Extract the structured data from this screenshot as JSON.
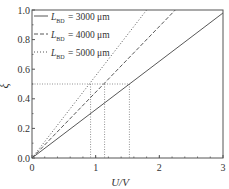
{
  "chart_data": {
    "type": "line",
    "title": "",
    "xlabel": "U/V",
    "ylabel": "ξ",
    "xlim": [
      0,
      3
    ],
    "ylim": [
      0,
      1.0
    ],
    "xticks": [
      0,
      1,
      2,
      3
    ],
    "xtick_labels": [
      "0",
      "1",
      "2",
      "3"
    ],
    "yticks": [
      0.0,
      0.2,
      0.4,
      0.6,
      0.8,
      1.0
    ],
    "ytick_labels": [
      "0.0",
      "0.2",
      "0.4",
      "0.6",
      "0.8",
      "1.0"
    ],
    "grid": false,
    "legend_position": "upper left",
    "series": [
      {
        "name": "L_BD = 3000 μm",
        "label_main": "L",
        "label_sub": "BD",
        "label_value": "= 3000 μm",
        "style": "solid",
        "x": [
          0,
          3
        ],
        "y": [
          0,
          0.98
        ],
        "slope": 0.327
      },
      {
        "name": "L_BD = 4000 μm",
        "label_main": "L",
        "label_sub": "BD",
        "label_value": "= 4000 μm",
        "style": "dashed",
        "x": [
          0,
          2.25
        ],
        "y": [
          0,
          1.0
        ],
        "slope": 0.44
      },
      {
        "name": "L_BD = 5000 μm",
        "label_main": "L",
        "label_sub": "BD",
        "label_value": "= 5000 μm",
        "style": "dotted",
        "x": [
          0,
          1.8
        ],
        "y": [
          0,
          1.0
        ],
        "slope": 0.555
      }
    ],
    "annotations": {
      "reference_level_y": 0.5,
      "crossing_points_x": [
        0.92,
        1.14,
        1.53
      ],
      "style": "dotted guide lines"
    }
  },
  "colors": {
    "line": "#444444",
    "axis": "#555555",
    "guide": "#777777"
  }
}
